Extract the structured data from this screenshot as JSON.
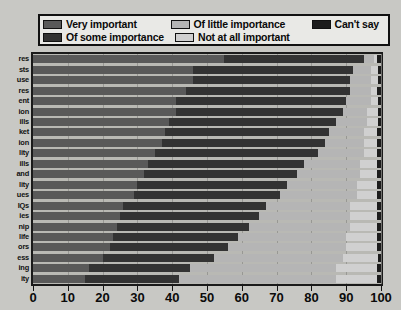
{
  "legend": {
    "items": [
      {
        "label": "Very important",
        "color": "#595959",
        "name": "legend-very-important"
      },
      {
        "label": "Of little importance",
        "color": "#b5b5b5",
        "name": "legend-of-little-importance"
      },
      {
        "label": "Can't say",
        "color": "#1c1c1c",
        "name": "legend-cant-say"
      },
      {
        "label": "Of some importance",
        "color": "#333333",
        "name": "legend-of-some-importance"
      },
      {
        "label": "Not at all important",
        "color": "#d0d0d0",
        "name": "legend-not-at-all-important"
      }
    ]
  },
  "chart_data": {
    "type": "bar",
    "title": "",
    "xlabel": "",
    "ylabel": "",
    "orientation": "horizontal",
    "stacked": true,
    "stack_mode": "percent",
    "grid": true,
    "legend_position": "top",
    "xlim": [
      0,
      100
    ],
    "xticks": [
      0,
      10,
      20,
      30,
      40,
      50,
      60,
      70,
      80,
      90,
      100
    ],
    "xticklabels": [
      "0",
      "10",
      "20",
      "30",
      "40",
      "50",
      "60",
      "70",
      "80",
      "90",
      "100"
    ],
    "colors": {
      "Very important": "#595959",
      "Of some importance": "#333333",
      "Of little importance": "#b5b5b5",
      "Not at all important": "#d0d0d0",
      "Can't say": "#1c1c1c"
    },
    "categories": [
      "res",
      "sts",
      "use",
      "res",
      "ent",
      "ion",
      "ills",
      "ket",
      "ion",
      "lity",
      "ills",
      "and",
      "lity",
      "ues",
      "IQs",
      "ies",
      "nip",
      "life",
      "ors",
      "ess",
      "ing",
      "ity"
    ],
    "series": [
      {
        "name": "Very important",
        "values": [
          55,
          46,
          46,
          44,
          41,
          41,
          39,
          38,
          37,
          35,
          33,
          32,
          30,
          29,
          26,
          25,
          24,
          23,
          22,
          20,
          16,
          15
        ]
      },
      {
        "name": "Of some importance",
        "values": [
          40,
          46,
          45,
          47,
          49,
          48,
          48,
          47,
          47,
          47,
          45,
          44,
          43,
          42,
          41,
          40,
          38,
          36,
          34,
          32,
          29,
          27
        ]
      },
      {
        "name": "Of little importance",
        "values": [
          3,
          5,
          6,
          6,
          7,
          7,
          9,
          10,
          11,
          13,
          16,
          18,
          20,
          22,
          24,
          26,
          29,
          31,
          34,
          37,
          42,
          45
        ]
      },
      {
        "name": "Not at all important",
        "values": [
          1,
          2,
          2,
          2,
          2,
          3,
          3,
          4,
          4,
          4,
          5,
          5,
          6,
          6,
          8,
          8,
          8,
          9,
          9,
          10,
          12,
          12
        ]
      },
      {
        "name": "Can't say",
        "values": [
          1,
          1,
          1,
          1,
          1,
          1,
          1,
          1,
          1,
          1,
          1,
          1,
          1,
          1,
          1,
          1,
          1,
          1,
          1,
          1,
          1,
          1
        ]
      }
    ]
  }
}
